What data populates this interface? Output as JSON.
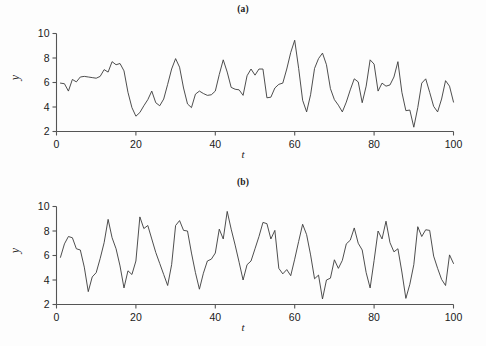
{
  "figure": {
    "background": "#fdfdfd",
    "line_color": "#3a3a3a",
    "axis_color": "#555555"
  },
  "panels": [
    {
      "id": "a",
      "title": "(a)",
      "xlabel": "t",
      "ylabel": "y"
    },
    {
      "id": "b",
      "title": "(b)",
      "xlabel": "t",
      "ylabel": "y"
    }
  ],
  "axis": {
    "x_ticks": [
      "0",
      "20",
      "40",
      "60",
      "80",
      "100"
    ],
    "y_ticks": [
      "2",
      "4",
      "6",
      "8",
      "10"
    ],
    "x_tick_values": [
      0,
      20,
      40,
      60,
      80,
      100
    ],
    "y_tick_values": [
      2,
      4,
      6,
      8,
      10
    ]
  },
  "chart_data": [
    {
      "type": "line",
      "title": "(a)",
      "xlabel": "t",
      "ylabel": "y",
      "xlim": [
        0,
        100
      ],
      "ylim": [
        2,
        10
      ],
      "grid": false,
      "legend": "none",
      "x": [
        1,
        2,
        3,
        4,
        5,
        6,
        7,
        8,
        9,
        10,
        11,
        12,
        13,
        14,
        15,
        16,
        17,
        18,
        19,
        20,
        21,
        22,
        23,
        24,
        25,
        26,
        27,
        28,
        29,
        30,
        31,
        32,
        33,
        34,
        35,
        36,
        37,
        38,
        39,
        40,
        41,
        42,
        43,
        44,
        45,
        46,
        47,
        48,
        49,
        50,
        51,
        52,
        53,
        54,
        55,
        56,
        57,
        58,
        59,
        60,
        61,
        62,
        63,
        64,
        65,
        66,
        67,
        68,
        69,
        70,
        71,
        72,
        73,
        74,
        75,
        76,
        77,
        78,
        79,
        80,
        81,
        82,
        83,
        84,
        85,
        86,
        87,
        88,
        89,
        90,
        91,
        92,
        93,
        94,
        95,
        96,
        97,
        98,
        99,
        100
      ],
      "y": [
        5.95,
        5.9,
        5.3,
        6.25,
        6.05,
        6.45,
        6.5,
        6.45,
        6.4,
        6.35,
        6.5,
        7.05,
        6.85,
        7.7,
        7.45,
        7.55,
        6.95,
        5.2,
        3.95,
        3.25,
        3.55,
        4.1,
        4.6,
        5.3,
        4.35,
        4.1,
        4.65,
        5.85,
        7.1,
        7.95,
        7.25,
        5.55,
        4.25,
        3.95,
        5.05,
        5.3,
        5.1,
        4.95,
        5.0,
        5.3,
        6.65,
        7.85,
        6.85,
        5.6,
        5.45,
        5.4,
        4.95,
        6.55,
        7.1,
        6.6,
        7.1,
        7.1,
        4.75,
        4.8,
        5.55,
        5.85,
        5.95,
        7.1,
        8.45,
        9.45,
        7.15,
        4.55,
        3.6,
        5.0,
        7.15,
        7.95,
        8.4,
        7.45,
        5.5,
        4.6,
        4.15,
        3.6,
        4.4,
        5.4,
        6.3,
        6.05,
        4.35,
        5.7,
        7.85,
        7.5,
        5.3,
        5.95,
        5.7,
        5.8,
        6.45,
        7.7,
        5.2,
        3.7,
        3.75,
        2.35,
        3.95,
        5.95,
        6.3,
        5.2,
        4.05,
        3.6,
        4.65,
        6.15,
        5.7,
        4.4
      ]
    },
    {
      "type": "line",
      "title": "(b)",
      "xlabel": "t",
      "ylabel": "y",
      "xlim": [
        0,
        100
      ],
      "ylim": [
        2,
        10
      ],
      "grid": false,
      "legend": "none",
      "x": [
        1,
        2,
        3,
        4,
        5,
        6,
        7,
        8,
        9,
        10,
        11,
        12,
        13,
        14,
        15,
        16,
        17,
        18,
        19,
        20,
        21,
        22,
        23,
        24,
        25,
        26,
        27,
        28,
        29,
        30,
        31,
        32,
        33,
        34,
        35,
        36,
        37,
        38,
        39,
        40,
        41,
        42,
        43,
        44,
        45,
        46,
        47,
        48,
        49,
        50,
        51,
        52,
        53,
        54,
        55,
        56,
        57,
        58,
        59,
        60,
        61,
        62,
        63,
        64,
        65,
        66,
        67,
        68,
        69,
        70,
        71,
        72,
        73,
        74,
        75,
        76,
        77,
        78,
        79,
        80,
        81,
        82,
        83,
        84,
        85,
        86,
        87,
        88,
        89,
        90,
        91,
        92,
        93,
        94,
        95,
        96,
        97,
        98,
        99,
        100
      ],
      "y": [
        5.85,
        6.95,
        7.55,
        7.45,
        6.55,
        6.45,
        5.05,
        3.05,
        4.25,
        4.6,
        5.75,
        7.05,
        8.95,
        7.45,
        6.55,
        5.15,
        3.35,
        4.75,
        4.45,
        5.55,
        9.15,
        8.2,
        8.45,
        7.35,
        6.25,
        5.35,
        4.45,
        3.55,
        5.25,
        8.45,
        8.85,
        8.05,
        8.0,
        6.2,
        4.6,
        3.25,
        4.55,
        5.55,
        5.7,
        6.2,
        8.15,
        7.35,
        9.6,
        8.15,
        6.85,
        5.45,
        4.0,
        5.25,
        5.55,
        6.55,
        7.55,
        8.7,
        8.6,
        7.35,
        8.05,
        4.95,
        4.5,
        4.85,
        4.35,
        5.7,
        7.15,
        8.55,
        7.7,
        6.05,
        4.1,
        4.4,
        2.45,
        4.0,
        4.15,
        5.65,
        4.95,
        5.6,
        6.95,
        7.25,
        8.25,
        7.0,
        6.45,
        4.6,
        3.35,
        5.6,
        8.0,
        7.35,
        8.8,
        7.05,
        6.3,
        6.55,
        4.65,
        2.5,
        3.65,
        5.25,
        8.35,
        7.55,
        8.1,
        8.05,
        5.95,
        4.95,
        4.05,
        3.55,
        6.05,
        5.35
      ]
    }
  ]
}
